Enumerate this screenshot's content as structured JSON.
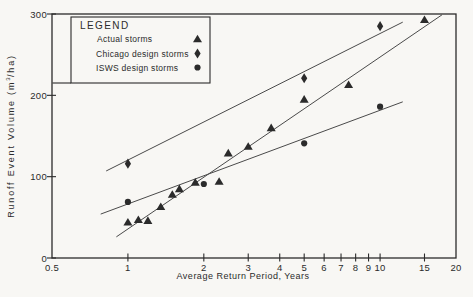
{
  "figure": {
    "background_color": "#f8f7f4",
    "ink_color": "#2b2b2b",
    "line_color": "#4a4a4a"
  },
  "legend": {
    "title": "LEGEND",
    "items": [
      {
        "label": "Actual storms",
        "marker": "triangle"
      },
      {
        "label": "Chicago design storms",
        "marker": "diamond"
      },
      {
        "label": "ISWS design storms",
        "marker": "circle"
      }
    ]
  },
  "chart_data": {
    "type": "scatter",
    "x_scale": "log",
    "grid": false,
    "legend_position": "upper-left-inside",
    "xlabel": "Average Return Period, Years",
    "ylabel": "Runoff Event Volume (m3/ha)",
    "ylabel_parts": {
      "pre": "Runoff Event Volume (m",
      "sup": "3",
      "post": "/ha)"
    },
    "xlim": [
      0.5,
      20
    ],
    "ylim": [
      0,
      300
    ],
    "x_ticks": [
      "0.5",
      "1",
      "2",
      "3",
      "4",
      "5",
      "6",
      "7",
      "8",
      "9",
      "10",
      "15",
      "20"
    ],
    "y_ticks": [
      "0",
      "100",
      "200",
      "300"
    ],
    "series": [
      {
        "name": "Actual storms",
        "marker": "triangle",
        "points": [
          [
            1.0,
            44
          ],
          [
            1.1,
            47
          ],
          [
            1.2,
            46
          ],
          [
            1.35,
            63
          ],
          [
            1.5,
            78
          ],
          [
            1.6,
            85
          ],
          [
            1.85,
            93
          ],
          [
            2.3,
            94
          ],
          [
            2.5,
            129
          ],
          [
            3.0,
            137
          ],
          [
            3.7,
            160
          ],
          [
            5.0,
            195
          ],
          [
            7.5,
            213
          ],
          [
            15,
            293
          ]
        ],
        "trend": [
          [
            0.9,
            26
          ],
          [
            17.6,
            299
          ]
        ]
      },
      {
        "name": "Chicago design storms",
        "marker": "diamond",
        "points": [
          [
            1.0,
            116
          ],
          [
            5.0,
            221
          ],
          [
            10,
            285
          ]
        ],
        "trend": [
          [
            0.82,
            107
          ],
          [
            12.3,
            290
          ]
        ]
      },
      {
        "name": "ISWS design storms",
        "marker": "circle",
        "points": [
          [
            1.0,
            69
          ],
          [
            2.0,
            91
          ],
          [
            5.0,
            141
          ],
          [
            10,
            186
          ]
        ],
        "trend": [
          [
            0.78,
            54
          ],
          [
            12.3,
            192
          ]
        ]
      }
    ]
  }
}
